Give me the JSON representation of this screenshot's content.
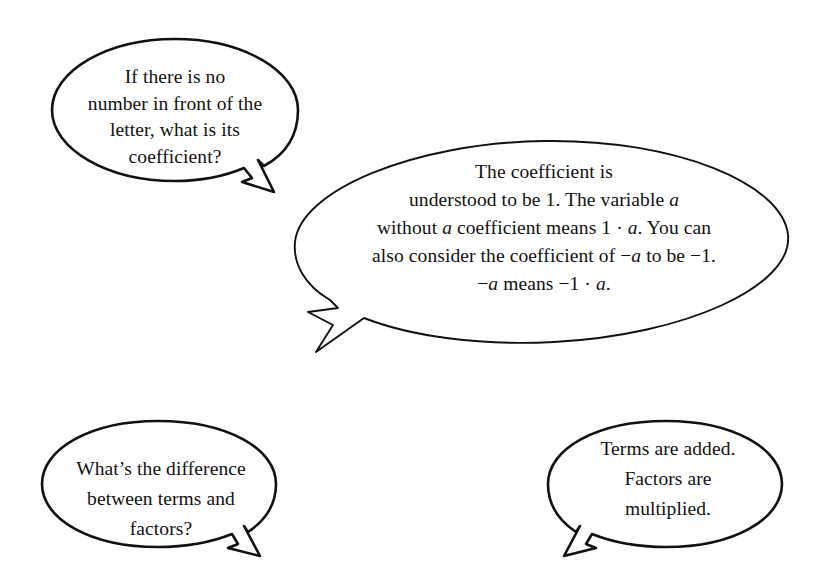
{
  "page": {
    "background_color": "#ffffff",
    "ink_color": "#111111",
    "kind": "textbook-speech-bubble-dialogue"
  },
  "bubbles": [
    {
      "id": "question-coefficient",
      "role": "question",
      "tail_direction": "down-right",
      "text": "If there is no\nnumber in front of the\nletter, what is its\ncoefficient?",
      "lines": [
        "If there is no",
        "number in front of the",
        "letter, what is its",
        "coefficient?"
      ]
    },
    {
      "id": "answer-coefficient",
      "role": "answer",
      "tail_direction": "down-left",
      "text": "The coefficient is\nunderstood to be 1. The variable a\nwithout a coefficient means 1 · a. You can\nalso consider the coefficient of −a to be −1.\n−a means −1 · a.",
      "lines": [
        "The coefficient is",
        "understood to be 1. The variable a",
        "without a coefficient means 1 · a. You can",
        "also consider the coefficient of −a to be −1.",
        "−a means −1 · a."
      ]
    },
    {
      "id": "question-terms-factors",
      "role": "question",
      "tail_direction": "down-right",
      "text": "What’s the difference\nbetween terms and\nfactors?",
      "lines": [
        "What’s the difference",
        "between terms and",
        "factors?"
      ]
    },
    {
      "id": "answer-terms-factors",
      "role": "answer",
      "tail_direction": "down-left",
      "text": "Terms are added.\nFactors are\nmultiplied.",
      "lines": [
        "Terms are added.",
        "Factors are",
        "multiplied."
      ]
    }
  ]
}
